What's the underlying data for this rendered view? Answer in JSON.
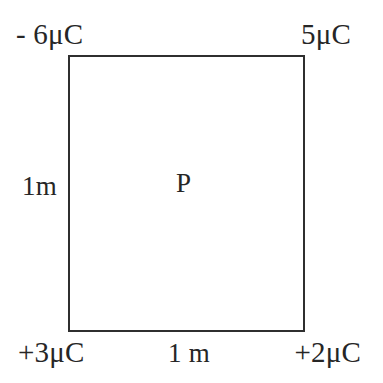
{
  "figure": {
    "type": "physics-diagram",
    "background_color": "#ffffff",
    "line_color": "#2f2f2f",
    "text_color": "#262626"
  },
  "shape": {
    "name": "square",
    "stroke_width_px": 2
  },
  "charges": {
    "top_left": "- 6μC",
    "top_right": "5μC",
    "bottom_left": "+3μC",
    "bottom_right": "+2μC"
  },
  "dimensions": {
    "left_side": "1m",
    "bottom_side": "1 m"
  },
  "center_point": {
    "label": "P"
  }
}
